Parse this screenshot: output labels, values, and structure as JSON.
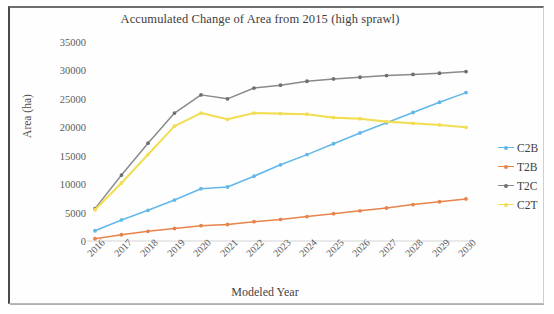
{
  "figure": {
    "title": "Accumulated Change of Area from 2015 (high sprawl)",
    "xaxis_title": "Modeled Year",
    "yaxis_title": "Area (ha)"
  },
  "legend": {
    "position": "right",
    "entries": [
      {
        "label": "C2B",
        "color": "#62b8e8"
      },
      {
        "label": "T2B",
        "color": "#e8834a"
      },
      {
        "label": "T2C",
        "color": "#8a8a8a"
      },
      {
        "label": "C2T",
        "color": "#f2dd53"
      }
    ]
  },
  "chart_data": {
    "type": "line",
    "title": "Accumulated Change of Area from 2015 (high sprawl)",
    "xlabel": "Modeled Year",
    "ylabel": "Area (ha)",
    "grid": false,
    "legend_position": "right",
    "ylim": [
      0,
      35000
    ],
    "ytick_labels": [
      "35000",
      "30000",
      "25000",
      "20000",
      "15000",
      "10000",
      "5000",
      "0"
    ],
    "yticks": [
      35000,
      30000,
      25000,
      20000,
      15000,
      10000,
      5000,
      0
    ],
    "categories": [
      "2016",
      "2017",
      "2018",
      "2019",
      "2020",
      "2021",
      "2022",
      "2023",
      "2024",
      "2025",
      "2026",
      "2027",
      "2028",
      "2029",
      "2030"
    ],
    "x": [
      2016,
      2017,
      2018,
      2019,
      2020,
      2021,
      2022,
      2023,
      2024,
      2025,
      2026,
      2027,
      2028,
      2029,
      2030
    ],
    "series": [
      {
        "name": "C2B",
        "color": "#62b8e8",
        "values": [
          1800,
          3700,
          5400,
          7200,
          9200,
          9500,
          11400,
          13400,
          15200,
          17100,
          19000,
          20800,
          22600,
          24400,
          26100
        ]
      },
      {
        "name": "T2B",
        "color": "#e8834a",
        "values": [
          400,
          1100,
          1700,
          2200,
          2700,
          2900,
          3400,
          3800,
          4300,
          4800,
          5300,
          5800,
          6400,
          6900,
          7400
        ]
      },
      {
        "name": "T2C",
        "color": "#8a8a8a",
        "values": [
          5700,
          11600,
          17200,
          22500,
          25700,
          25000,
          26900,
          27400,
          28100,
          28500,
          28800,
          29100,
          29300,
          29500,
          29800
        ]
      },
      {
        "name": "C2T",
        "color": "#f2dd53",
        "values": [
          5500,
          10200,
          15200,
          20200,
          22500,
          21400,
          22500,
          22400,
          22300,
          21700,
          21500,
          21000,
          20700,
          20400,
          20000
        ]
      }
    ]
  }
}
